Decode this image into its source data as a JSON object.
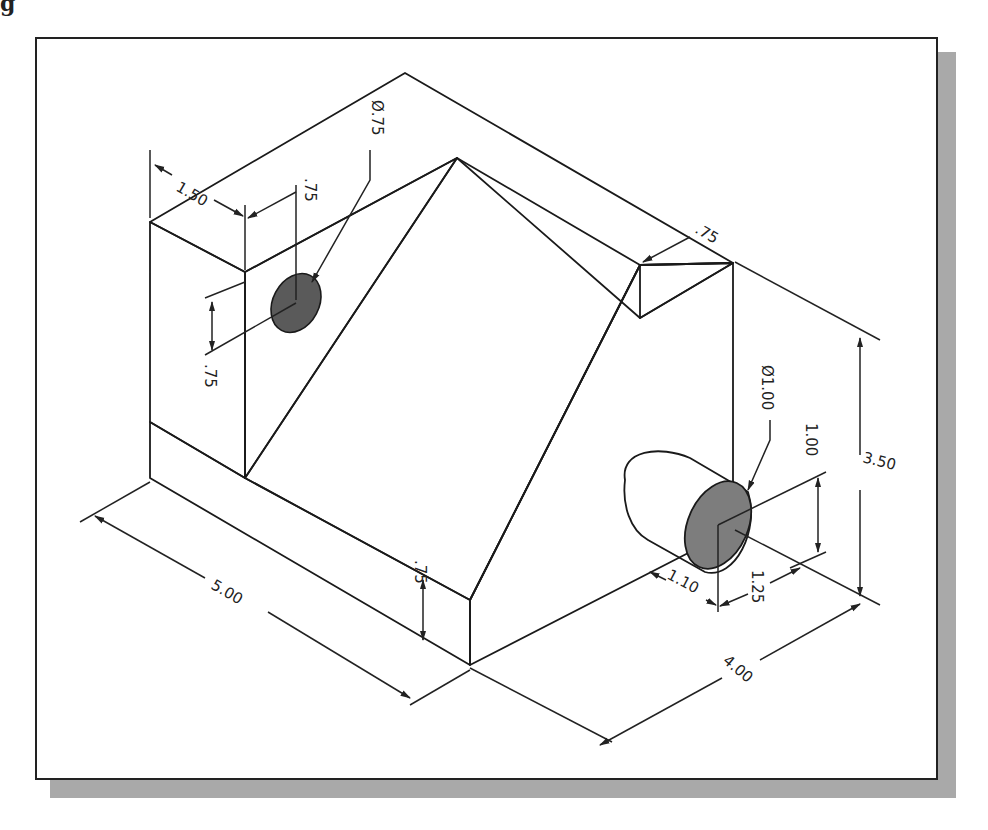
{
  "figure": {
    "label_fragment": "g"
  },
  "colors": {
    "frame_border": "#222222",
    "frame_shadow": "#a9a9a9",
    "face_top": "#c4c4c4",
    "face_front_left": "#a8a8a8",
    "face_inclined": "#b8b8b8",
    "face_right": "#8c8c8c",
    "face_dark_inner": "#6e6e6e",
    "boss_side": "#b0b0b0",
    "boss_end": "#7d7d7d"
  },
  "dimensions": {
    "top_width": "1.50",
    "hole_offset_top": ".75",
    "hole_diameter": "Ø.75",
    "hole_offset_side": ".75",
    "right_top_ledge": ".75",
    "overall_height": "3.50",
    "boss_diameter": "Ø1.00",
    "boss_height_offset": "1.00",
    "boss_length": "1.10",
    "boss_side_offset": "1.25",
    "base_thickness": ".75",
    "overall_length": "5.00",
    "overall_depth": "4.00"
  }
}
